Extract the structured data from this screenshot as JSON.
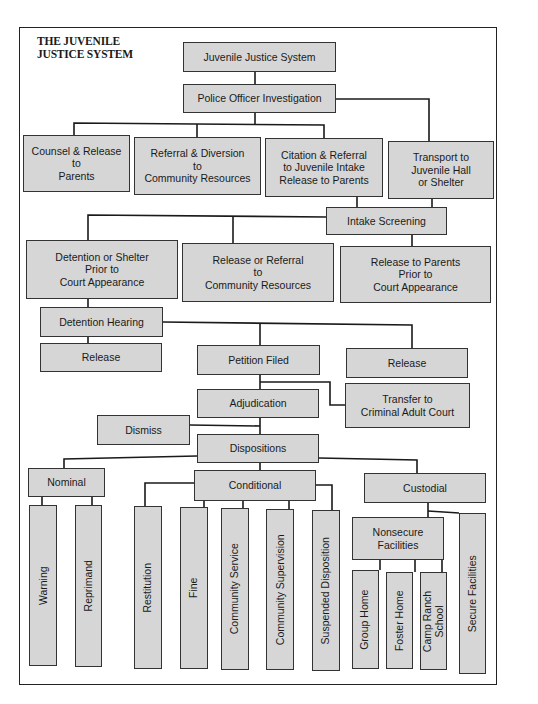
{
  "title": "THE JUVENILE\nJUSTICE SYSTEM",
  "colors": {
    "box_fill": "#d6d6d6",
    "border": "#333333",
    "line": "#1a1a1a",
    "background": "#ffffff"
  },
  "nodes": {
    "root": "Juvenile Justice System",
    "police": "Police Officer Investigation",
    "counsel": "Counsel & Release\nto\nParents",
    "referral_diversion": "Referral & Diversion\nto\nCommunity Resources",
    "citation": "Citation & Referral\nto Juvenile Intake\nRelease to Parents",
    "transport": "Transport to\nJuvenile Hall\nor Shelter",
    "intake": "Intake Screening",
    "detention_shelter": "Detention or Shelter\nPrior to\nCourt Appearance",
    "release_referral": "Release or Referral\nto\nCommunity Resources",
    "release_parents": "Release to Parents\nPrior to\nCourt Appearance",
    "detention_hearing": "Detention Hearing",
    "release_left": "Release",
    "petition": "Petition Filed",
    "release_right": "Release",
    "adjudication": "Adjudication",
    "transfer": "Transfer to\nCriminal Adult Court",
    "dismiss": "Dismiss",
    "dispositions": "Dispositions",
    "nominal": "Nominal",
    "conditional": "Conditional",
    "custodial": "Custodial",
    "warning": "Warning",
    "reprimand": "Reprimand",
    "restitution": "Restitution",
    "fine": "Fine",
    "community_service": "Community Service",
    "community_supervision": "Community Supervision",
    "suspended": "Suspended Disposition",
    "nonsecure": "Nonsecure\nFacilities",
    "group_home": "Group Home",
    "foster_home": "Foster Home",
    "camp": "Camp Ranch\nSchool",
    "secure": "Secure Facilities"
  }
}
